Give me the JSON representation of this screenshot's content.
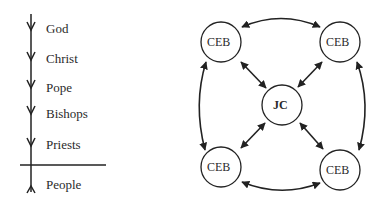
{
  "hierarchy": {
    "levels": [
      "God",
      "Christ",
      "Pope",
      "Bishops",
      "Priests"
    ],
    "below_line": "People"
  },
  "network": {
    "center": "JC",
    "nodes": [
      "CEB",
      "CEB",
      "CEB",
      "CEB"
    ]
  }
}
